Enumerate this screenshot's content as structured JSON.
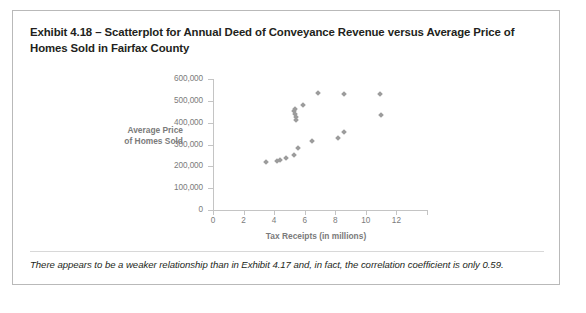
{
  "exhibit": {
    "title": "Exhibit 4.18 – Scatterplot for Annual Deed of Conveyance Revenue versus Average Price of Homes Sold in Fairfax County",
    "caption": "There appears to be a weaker relationship than in Exhibit 4.17 and, in fact, the correlation coefficient is only 0.59."
  },
  "chart_data": {
    "type": "scatter",
    "title": "",
    "xlabel": "Tax Receipts (in millions)",
    "ylabel": "Average Price of Homes Sold",
    "ylabel_lines": [
      "Average Price",
      "of Homes Sold"
    ],
    "xlim": [
      0,
      14
    ],
    "ylim": [
      0,
      600000
    ],
    "xticks": [
      0,
      2,
      4,
      6,
      8,
      10,
      12,
      14
    ],
    "xtick_labels": [
      "0",
      "2",
      "4",
      "6",
      "8",
      "10",
      "12",
      ""
    ],
    "yticks": [
      0,
      100000,
      200000,
      300000,
      400000,
      500000,
      600000
    ],
    "ytick_labels": [
      "0",
      "100,000",
      "200,000",
      "300,000",
      "400,000",
      "500,000",
      "600,000"
    ],
    "grid": false,
    "legend": false,
    "marker": "diamond",
    "marker_color": "#9c9c9c",
    "axis_color": "#c4c4c4",
    "tick_label_color": "#7b7b7b",
    "points": [
      {
        "x": 3.45,
        "y": 220000
      },
      {
        "x": 4.2,
        "y": 225000
      },
      {
        "x": 4.4,
        "y": 228000
      },
      {
        "x": 4.75,
        "y": 237000
      },
      {
        "x": 5.3,
        "y": 252000
      },
      {
        "x": 5.55,
        "y": 283000
      },
      {
        "x": 5.3,
        "y": 455000
      },
      {
        "x": 5.35,
        "y": 440000
      },
      {
        "x": 5.4,
        "y": 428000
      },
      {
        "x": 5.45,
        "y": 412000
      },
      {
        "x": 5.35,
        "y": 462000
      },
      {
        "x": 5.9,
        "y": 482000
      },
      {
        "x": 6.5,
        "y": 318000
      },
      {
        "x": 6.85,
        "y": 535000
      },
      {
        "x": 8.2,
        "y": 332000
      },
      {
        "x": 8.55,
        "y": 356000
      },
      {
        "x": 8.6,
        "y": 533000
      },
      {
        "x": 10.9,
        "y": 533000
      },
      {
        "x": 11.0,
        "y": 437000
      }
    ]
  }
}
